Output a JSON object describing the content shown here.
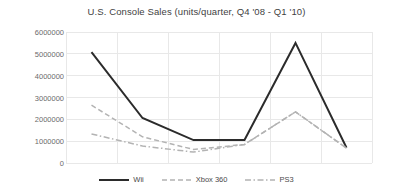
{
  "chart_data": {
    "type": "line",
    "title": "U.S. Console Sales (units/quarter, Q4 '08 - Q1 '10)",
    "xlabel": "",
    "ylabel": "",
    "ylim": [
      0,
      6000000
    ],
    "ytick_labels": [
      "6000000",
      "5000000",
      "4000000",
      "3000000",
      "2000000",
      "1000000",
      "0"
    ],
    "ytick_values": [
      6000000,
      5000000,
      4000000,
      3000000,
      2000000,
      1000000,
      0
    ],
    "categories": [
      "Q4 '08",
      "Q1 '09",
      "Q2 '09",
      "Q3 '09",
      "Q4 '09",
      "Q1 '10"
    ],
    "xtick_labels": [
      "",
      "",
      "",
      "",
      "",
      ""
    ],
    "grid": true,
    "legend_position": "bottom",
    "series": [
      {
        "name": "Wii",
        "color": "#2b2b2b",
        "style": "solid",
        "width": 2.0,
        "values": [
          5080000,
          2060000,
          1050000,
          1050000,
          5500000,
          700000
        ]
      },
      {
        "name": "Xbox 360",
        "color": "#b3b3b3",
        "style": "dashed",
        "width": 1.5,
        "values": [
          2650000,
          1200000,
          620000,
          850000,
          2340000,
          680000
        ]
      },
      {
        "name": "PS3",
        "color": "#b3b3b3",
        "style": "dashdot",
        "width": 1.5,
        "values": [
          1330000,
          780000,
          500000,
          850000,
          2340000,
          680000
        ]
      }
    ]
  },
  "legend": {
    "items": [
      {
        "label": "Wii"
      },
      {
        "label": "Xbox 360"
      },
      {
        "label": "PS3"
      }
    ]
  },
  "colors": {
    "wii": "#2b2b2b",
    "xbox360": "#b3b3b3",
    "ps3": "#b3b3b3",
    "grid": "#e8e8e8",
    "text": "#595959",
    "background": "#ffffff"
  }
}
